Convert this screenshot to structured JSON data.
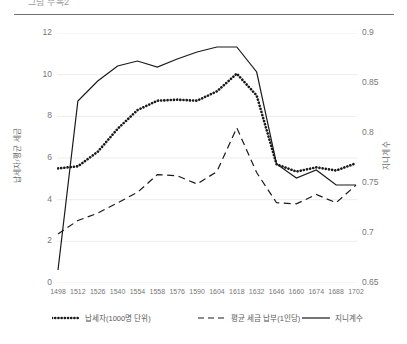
{
  "chart": {
    "title": "그림  부록2",
    "left_axis_title": "납세자/평균 세금",
    "right_axis_title": "지니계수"
  },
  "chart_data": {
    "type": "line",
    "title": "그림  부록2",
    "xlabel": "",
    "ylabel": "납세자/평균 세금",
    "y2label": "지니계수",
    "grid": true,
    "legend_position": "bottom",
    "categories": [
      1498,
      1512,
      1526,
      1540,
      1554,
      1568,
      1582,
      1596,
      1610,
      1624,
      1638,
      1652,
      1666,
      1680,
      1694,
      1708
    ],
    "x_tick_labels": [
      "1498",
      "1512",
      "1526",
      "1540",
      "1554",
      "1558",
      "1576",
      "1590",
      "1604",
      "1618",
      "1632",
      "1646",
      "1660",
      "1674",
      "1688",
      "1702"
    ],
    "ylim": [
      0,
      12
    ],
    "y_ticks": [
      0,
      2,
      4,
      6,
      8,
      10,
      12
    ],
    "y2lim": [
      0.65,
      0.9
    ],
    "y2_ticks": [
      0.65,
      0.7,
      0.75,
      0.8,
      0.85,
      0.9
    ],
    "series": [
      {
        "name": "납세자(1000명 단위)",
        "axis": "left",
        "style": "dotted",
        "color": "#1a1a1a",
        "values": [
          5.5,
          5.6,
          6.3,
          7.4,
          8.3,
          8.75,
          8.8,
          8.75,
          9.2,
          10.05,
          9.0,
          5.7,
          5.35,
          5.55,
          5.4,
          5.75
        ]
      },
      {
        "name": "평균 세금 납부(1인당)",
        "axis": "left",
        "style": "dashed",
        "color": "#1a1a1a",
        "values": [
          2.35,
          3.0,
          3.35,
          3.85,
          4.35,
          5.2,
          5.15,
          4.75,
          5.35,
          7.45,
          5.3,
          3.85,
          3.8,
          4.25,
          3.85,
          4.7
        ]
      },
      {
        "name": "지니계수",
        "axis": "right",
        "style": "solid",
        "color": "#1a1a1a",
        "values": [
          0.663,
          0.832,
          0.852,
          0.867,
          0.872,
          0.866,
          0.874,
          0.881,
          0.886,
          0.886,
          0.861,
          0.769,
          0.755,
          0.763,
          0.748,
          0.748
        ]
      }
    ]
  },
  "legend": [
    {
      "label": "납세자(1000명 단위)",
      "style": "dotted"
    },
    {
      "label": "평균 세금 납부(1인당)",
      "style": "dashed"
    },
    {
      "label": "지니계수",
      "style": "solid"
    }
  ]
}
